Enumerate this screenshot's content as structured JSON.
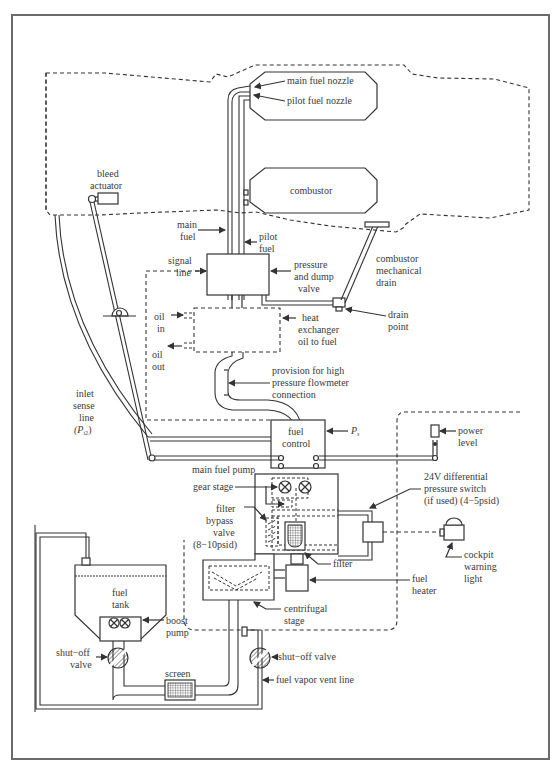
{
  "diagram": {
    "labels": {
      "main_fuel_nozzle": "main fuel nozzle",
      "pilot_fuel_nozzle": "pilot fuel nozzle",
      "combustor": "combustor",
      "bleed_actuator_1": "bleed",
      "bleed_actuator_2": "actuator",
      "main_fuel_1": "main",
      "main_fuel_2": "fuel",
      "pilot_fuel_1": "pilot",
      "pilot_fuel_2": "fuel",
      "signal_line_1": "signal",
      "signal_line_2": "line",
      "pressure_dump_1": "pressure",
      "pressure_dump_2": "and dump",
      "pressure_dump_3": "valve",
      "combustor_drain_1": "combustor",
      "combustor_drain_2": "mechanical",
      "combustor_drain_3": "drain",
      "oil_in_1": "oil",
      "oil_in_2": "in",
      "oil_out_1": "oil",
      "oil_out_2": "out",
      "heat_exchanger_1": "heat",
      "heat_exchanger_2": "exchanger",
      "heat_exchanger_3": "oil to fuel",
      "drain_point_1": "drain",
      "drain_point_2": "point",
      "flowmeter_1": "provision for high",
      "flowmeter_2": "pressure flowmeter",
      "flowmeter_3": "connection",
      "inlet_sense_1": "inlet",
      "inlet_sense_2": "sense",
      "inlet_sense_3": "line",
      "inlet_sense_4": "(P",
      "inlet_sense_sub": "t2",
      "inlet_sense_5": ")",
      "fuel_control_1": "fuel",
      "fuel_control_2": "control",
      "ps": "P",
      "ps_sub": "s",
      "power_level_1": "power",
      "power_level_2": "level",
      "main_fuel_pump": "main fuel pump",
      "gear_stage": "gear stage",
      "diff_switch_1": "24V differential",
      "diff_switch_2": "pressure switch",
      "diff_switch_3": "(if used) (4−5psid)",
      "filter_bypass_1": "filter",
      "filter_bypass_2": "bypass",
      "filter_bypass_3": "valve",
      "filter_bypass_4": "(8−10psid)",
      "cockpit_1": "cockpit",
      "cockpit_2": "warning",
      "cockpit_3": "light",
      "filter": "filter",
      "fuel_heater_1": "fuel",
      "fuel_heater_2": "heater",
      "centrifugal_1": "centrifugal",
      "centrifugal_2": "stage",
      "fuel_tank_1": "fuel",
      "fuel_tank_2": "tank",
      "boost_pump_1": "boost",
      "boost_pump_2": "pump",
      "shutoff_left_1": "shut−off",
      "shutoff_left_2": "valve",
      "shutoff_right": "shut−off valve",
      "screen": "screen",
      "vent_line": "fuel vapor vent line"
    },
    "colors": {
      "line": "#333333",
      "text": "#3a3a3a",
      "frame": "#6b6b6b",
      "background": "#ffffff"
    }
  }
}
